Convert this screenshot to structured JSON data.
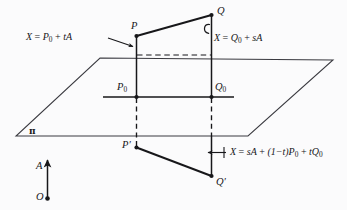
{
  "figure": {
    "type": "geometry-diagram",
    "background_color": "#fbfbfc",
    "ink_color": "#17171a"
  },
  "points": {
    "P": {
      "label": "P"
    },
    "Q": {
      "label": "Q"
    },
    "P0": {
      "label": "P",
      "subscript": "0"
    },
    "Q0": {
      "label": "Q",
      "subscript": "0"
    },
    "Pprime": {
      "label": "P′"
    },
    "Qprime": {
      "label": "Q′"
    },
    "O": {
      "label": "O"
    }
  },
  "vectors": {
    "A": {
      "label": "A"
    }
  },
  "plane": {
    "label": "π"
  },
  "annotations": {
    "left_line_equation": {
      "prefix": "X",
      "equals": "=",
      "base": "P",
      "base_sub": "0",
      "plus": "+",
      "term": "tA",
      "full": "X = P₀ + tA"
    },
    "right_line_equation": {
      "prefix": "X",
      "equals": "=",
      "base": "Q",
      "base_sub": "0",
      "plus": "+",
      "term": "sA",
      "full": "X = Q₀ + sA"
    },
    "plane_equation": {
      "prefix": "X",
      "equals": "=",
      "term1": "sA",
      "plus1": "+",
      "term2": "(1−t)P",
      "term2_sub": "0",
      "plus2": "+",
      "term3": "tQ",
      "term3_sub": "0",
      "full": "X = sA + (1−t)P₀ + tQ₀"
    }
  }
}
